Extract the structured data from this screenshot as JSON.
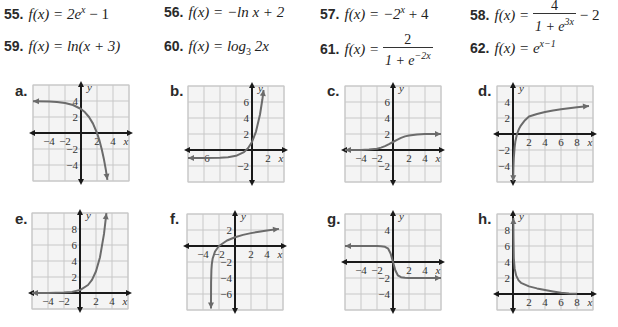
{
  "problems": [
    {
      "num": "55.",
      "lhs": "f(x) = 2e",
      "sup": "x",
      "rest": " − 1"
    },
    {
      "num": "56.",
      "lhs": "f(x) = −ln x + 2"
    },
    {
      "num": "57.",
      "lhs": "f(x) = −2",
      "sup": "x",
      "rest": " + 4"
    },
    {
      "num": "58.",
      "lhs": "f(x) = ",
      "frac_num": "4",
      "frac_den": "1 + e",
      "frac_den_sup": "3x",
      "rest": " − 2"
    },
    {
      "num": "59.",
      "lhs": "f(x) = ln(x + 3)"
    },
    {
      "num": "60.",
      "lhs": "f(x) = log",
      "sub": "3",
      "rest": " 2x"
    },
    {
      "num": "61.",
      "lhs": "f(x) = ",
      "frac_num": "2",
      "frac_den": "1 + e",
      "frac_den_sup": "−2x"
    },
    {
      "num": "62.",
      "lhs": "f(x) = e",
      "sup": "x−1"
    }
  ],
  "chart_data": [
    {
      "label": "a.",
      "type": "line",
      "xlabel": "x",
      "ylabel": "y",
      "xlim": [
        -6,
        6
      ],
      "ylim": [
        -6,
        6
      ],
      "grid": true,
      "xticks": [
        -4,
        -2,
        2,
        4
      ],
      "yticks": [
        4,
        2,
        -2,
        -4
      ],
      "points": [
        [
          -6,
          3.98
        ],
        [
          -4,
          3.94
        ],
        [
          -3,
          3.88
        ],
        [
          -2,
          3.75
        ],
        [
          -1,
          3.5
        ],
        [
          0,
          3
        ],
        [
          0.5,
          2.59
        ],
        [
          1,
          2
        ],
        [
          1.5,
          1.17
        ],
        [
          2,
          0
        ],
        [
          2.3,
          -0.92
        ],
        [
          2.6,
          -2.06
        ],
        [
          2.85,
          -3.21
        ],
        [
          3.1,
          -4.57
        ],
        [
          3.3,
          -5.85
        ]
      ],
      "arrow_start": true,
      "arrow_end": true
    },
    {
      "label": "b.",
      "type": "line",
      "xlabel": "x",
      "ylabel": "y",
      "xlim": [
        -8,
        4
      ],
      "ylim": [
        -4,
        8
      ],
      "grid": true,
      "xticks": [
        -6,
        2
      ],
      "yticks": [
        6,
        4,
        2,
        -2
      ],
      "points": [
        [
          -8,
          -1
        ],
        [
          -6,
          -0.995
        ],
        [
          -4,
          -0.96
        ],
        [
          -3,
          -0.9
        ],
        [
          -2,
          -0.73
        ],
        [
          -1,
          -0.26
        ],
        [
          -0.5,
          0.21
        ],
        [
          0,
          1
        ],
        [
          0.5,
          2.3
        ],
        [
          1,
          4.44
        ],
        [
          1.3,
          6.34
        ],
        [
          1.45,
          7.5
        ]
      ],
      "arrow_start": true,
      "arrow_end": true
    },
    {
      "label": "c.",
      "type": "line",
      "xlabel": "x",
      "ylabel": "y",
      "xlim": [
        -6,
        6
      ],
      "ylim": [
        -4,
        8
      ],
      "grid": true,
      "xticks": [
        -4,
        -2,
        2,
        4
      ],
      "yticks": [
        6,
        4,
        2,
        -2
      ],
      "points": [
        [
          -6,
          0
        ],
        [
          -4,
          0.01
        ],
        [
          -3,
          0.05
        ],
        [
          -2,
          0.15
        ],
        [
          -1.5,
          0.3
        ],
        [
          -1,
          0.48
        ],
        [
          -0.5,
          0.73
        ],
        [
          0,
          1
        ],
        [
          0.5,
          1.27
        ],
        [
          1,
          1.52
        ],
        [
          1.5,
          1.7
        ],
        [
          2,
          1.82
        ],
        [
          3,
          1.95
        ],
        [
          4,
          1.99
        ],
        [
          6,
          2
        ]
      ],
      "arrow_start": true,
      "arrow_end": true
    },
    {
      "label": "d.",
      "type": "line",
      "xlabel": "x",
      "ylabel": "y",
      "xlim": [
        -2,
        10
      ],
      "ylim": [
        -6,
        6
      ],
      "grid": true,
      "xticks": [
        2,
        4,
        6,
        8
      ],
      "yticks": [
        4,
        2,
        -2,
        -4
      ],
      "points": [
        [
          0.02,
          -5.9
        ],
        [
          0.05,
          -4.2
        ],
        [
          0.1,
          -3
        ],
        [
          0.2,
          -1.7
        ],
        [
          0.3,
          -0.9
        ],
        [
          0.5,
          0
        ],
        [
          0.75,
          0.64
        ],
        [
          1,
          1.09
        ],
        [
          1.5,
          1.73
        ],
        [
          2,
          2.18
        ],
        [
          3,
          2.5
        ],
        [
          4,
          2.75
        ],
        [
          5,
          2.95
        ],
        [
          6,
          3.1
        ],
        [
          8,
          3.35
        ],
        [
          9.5,
          3.5
        ]
      ],
      "arrow_start": true,
      "arrow_end": true
    },
    {
      "label": "e.",
      "type": "line",
      "xlabel": "x",
      "ylabel": "y",
      "xlim": [
        -6,
        6
      ],
      "ylim": [
        -2,
        10
      ],
      "grid": true,
      "xticks": [
        -4,
        -2,
        2,
        4
      ],
      "yticks": [
        8,
        6,
        4,
        2
      ],
      "points": [
        [
          -6,
          0.001
        ],
        [
          -4,
          0.007
        ],
        [
          -2,
          0.05
        ],
        [
          -1,
          0.14
        ],
        [
          0,
          0.37
        ],
        [
          1,
          1
        ],
        [
          1.5,
          1.65
        ],
        [
          2,
          2.72
        ],
        [
          2.5,
          4.48
        ],
        [
          3,
          7.39
        ],
        [
          3.3,
          9.97
        ]
      ],
      "arrow_start": true,
      "arrow_end": true
    },
    {
      "label": "f.",
      "type": "line",
      "xlabel": "x",
      "ylabel": "y",
      "xlim": [
        -6,
        6
      ],
      "ylim": [
        -8,
        4
      ],
      "grid": true,
      "xticks": [
        -4,
        -2,
        2,
        4
      ],
      "yticks": [
        2,
        -2,
        -4,
        -6
      ],
      "points": [
        [
          -2.9997,
          -7.8
        ],
        [
          -2.999,
          -6.9
        ],
        [
          -2.99,
          -4.6
        ],
        [
          -2.95,
          -3
        ],
        [
          -2.9,
          -2.3
        ],
        [
          -2.8,
          -1.6
        ],
        [
          -2.5,
          -0.69
        ],
        [
          -2,
          0
        ],
        [
          -1,
          0.69
        ],
        [
          0,
          1.1
        ],
        [
          1,
          1.39
        ],
        [
          2,
          1.61
        ],
        [
          3,
          1.79
        ],
        [
          4,
          1.95
        ],
        [
          5.5,
          2.14
        ]
      ],
      "arrow_start": true,
      "arrow_end": true
    },
    {
      "label": "g.",
      "type": "line",
      "xlabel": "x",
      "ylabel": "y",
      "xlim": [
        -6,
        6
      ],
      "ylim": [
        -6,
        6
      ],
      "grid": true,
      "xticks": [
        -4,
        -2,
        2,
        4
      ],
      "yticks": [
        4,
        -2,
        -4
      ],
      "points": [
        [
          -6,
          2
        ],
        [
          -3,
          2
        ],
        [
          -2,
          1.99
        ],
        [
          -1.5,
          1.98
        ],
        [
          -1,
          1.9
        ],
        [
          -0.6,
          1.66
        ],
        [
          -0.3,
          1.07
        ],
        [
          0,
          0
        ],
        [
          0.3,
          -1.07
        ],
        [
          0.6,
          -1.66
        ],
        [
          1,
          -1.9
        ],
        [
          1.5,
          -1.98
        ],
        [
          2,
          -1.99
        ],
        [
          3,
          -2
        ],
        [
          6,
          -2
        ]
      ],
      "arrow_start": true,
      "arrow_end": true
    },
    {
      "label": "h.",
      "type": "line",
      "xlabel": "x",
      "ylabel": "y",
      "xlim": [
        -2,
        10
      ],
      "ylim": [
        -2,
        10
      ],
      "grid": true,
      "xticks": [
        2,
        4,
        6,
        8
      ],
      "yticks": [
        8,
        6,
        4,
        2
      ],
      "points": [
        [
          0.04,
          9.5
        ],
        [
          0.06,
          7
        ],
        [
          0.1,
          4.5
        ],
        [
          0.2,
          3.2
        ],
        [
          0.4,
          2.3
        ],
        [
          0.7,
          1.7
        ],
        [
          1,
          1.4
        ],
        [
          2,
          0.95
        ],
        [
          3,
          0.7
        ],
        [
          4,
          0.5
        ],
        [
          5,
          0.32
        ],
        [
          6,
          0.15
        ],
        [
          7,
          0.07
        ],
        [
          8,
          0.03
        ]
      ],
      "arrow_start": true,
      "arrow_end": false
    }
  ],
  "colors": {
    "grid": "#c8c8c8",
    "axis": "#1a1a1a",
    "curve": "#6b6b6b",
    "panel": "#f4f4f4"
  }
}
